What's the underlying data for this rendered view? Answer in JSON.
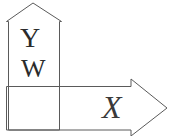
{
  "figure": {
    "background_color": "#ffffff",
    "stroke_color": "#5a5a5a",
    "text_color": "#2b2b2b",
    "canvas": {
      "width": 170,
      "height": 136
    },
    "labels": {
      "up_arrow_upper": "Y",
      "up_arrow_lower": "W",
      "right_arrow": "X"
    },
    "shapes": [
      {
        "name": "up-arrow",
        "direction": "up",
        "points": "33,3 62,22 60,22 60,130 8,130 8,22 6,22"
      },
      {
        "name": "right-arrow",
        "direction": "right",
        "points": "167,108 131,136 131,130 6,130 6,87 131,87 131,79"
      }
    ]
  }
}
